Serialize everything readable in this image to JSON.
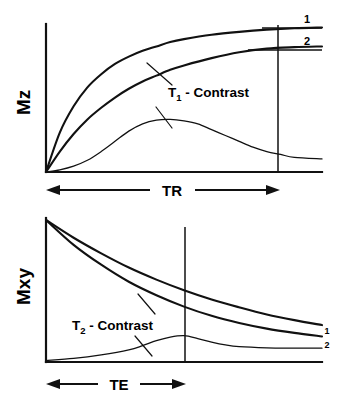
{
  "figure": {
    "background_color": "#ffffff",
    "ink_color": "#111111"
  },
  "chart_data": [
    {
      "type": "line",
      "panel": "top",
      "title": "",
      "xlabel": "TR",
      "ylabel": "Mz",
      "grid": false,
      "legend": "inline-end-labels",
      "annotation": "T1 - Contrast",
      "annotation_base": "T",
      "annotation_sub": "1",
      "annotation_rest": " - Contrast",
      "xlim": [
        0,
        1
      ],
      "ylim": [
        0,
        1
      ],
      "marker_x": 0.83,
      "marker_label": "TR",
      "series": [
        {
          "name": "1",
          "label": "1",
          "kind": "recovery",
          "amplitude": 1.0,
          "rate": 3.6,
          "points": [
            [
              0.0,
              0.0
            ],
            [
              0.05,
              0.27
            ],
            [
              0.1,
              0.45
            ],
            [
              0.15,
              0.58
            ],
            [
              0.2,
              0.67
            ],
            [
              0.25,
              0.74
            ],
            [
              0.3,
              0.79
            ],
            [
              0.35,
              0.83
            ],
            [
              0.4,
              0.86
            ],
            [
              0.45,
              0.89
            ],
            [
              0.5,
              0.91
            ],
            [
              0.6,
              0.94
            ],
            [
              0.7,
              0.96
            ],
            [
              0.8,
              0.975
            ],
            [
              0.9,
              0.985
            ],
            [
              1.0,
              0.99
            ]
          ]
        },
        {
          "name": "2",
          "label": "2",
          "kind": "recovery",
          "amplitude": 0.85,
          "rate": 2.0,
          "points": [
            [
              0.0,
              0.0
            ],
            [
              0.05,
              0.14
            ],
            [
              0.1,
              0.26
            ],
            [
              0.15,
              0.36
            ],
            [
              0.2,
              0.44
            ],
            [
              0.25,
              0.51
            ],
            [
              0.3,
              0.57
            ],
            [
              0.35,
              0.62
            ],
            [
              0.4,
              0.66
            ],
            [
              0.45,
              0.7
            ],
            [
              0.5,
              0.73
            ],
            [
              0.6,
              0.78
            ],
            [
              0.7,
              0.82
            ],
            [
              0.8,
              0.845
            ],
            [
              0.9,
              0.855
            ],
            [
              1.0,
              0.86
            ]
          ]
        },
        {
          "name": "difference",
          "label": "",
          "kind": "difference",
          "points": [
            [
              0.0,
              0.0
            ],
            [
              0.05,
              0.015
            ],
            [
              0.1,
              0.04
            ],
            [
              0.15,
              0.08
            ],
            [
              0.2,
              0.14
            ],
            [
              0.25,
              0.21
            ],
            [
              0.3,
              0.28
            ],
            [
              0.35,
              0.33
            ],
            [
              0.4,
              0.355
            ],
            [
              0.45,
              0.36
            ],
            [
              0.5,
              0.35
            ],
            [
              0.55,
              0.33
            ],
            [
              0.6,
              0.29
            ],
            [
              0.65,
              0.25
            ],
            [
              0.7,
              0.21
            ],
            [
              0.75,
              0.17
            ],
            [
              0.8,
              0.14
            ],
            [
              0.85,
              0.12
            ],
            [
              0.9,
              0.1
            ],
            [
              1.0,
              0.09
            ]
          ]
        }
      ]
    },
    {
      "type": "line",
      "panel": "bottom",
      "title": "",
      "xlabel": "TE",
      "ylabel": "Mxy",
      "grid": false,
      "legend": "inline-end-labels",
      "annotation": "T2 - Contrast",
      "annotation_base": "T",
      "annotation_sub": "2",
      "annotation_rest": " - Contrast",
      "xlim": [
        0,
        1
      ],
      "ylim": [
        0,
        1
      ],
      "marker_x": 0.5,
      "marker_label": "TE",
      "series": [
        {
          "name": "1",
          "label": "1",
          "kind": "decay",
          "amplitude": 1.0,
          "rate": 1.3,
          "points": [
            [
              0.0,
              1.0
            ],
            [
              0.1,
              0.875
            ],
            [
              0.2,
              0.765
            ],
            [
              0.3,
              0.665
            ],
            [
              0.4,
              0.58
            ],
            [
              0.5,
              0.505
            ],
            [
              0.6,
              0.44
            ],
            [
              0.7,
              0.385
            ],
            [
              0.8,
              0.335
            ],
            [
              0.9,
              0.295
            ],
            [
              1.0,
              0.26
            ]
          ]
        },
        {
          "name": "2",
          "label": "2",
          "kind": "decay",
          "amplitude": 1.0,
          "rate": 1.9,
          "points": [
            [
              0.0,
              1.0
            ],
            [
              0.1,
              0.825
            ],
            [
              0.2,
              0.685
            ],
            [
              0.3,
              0.565
            ],
            [
              0.4,
              0.47
            ],
            [
              0.5,
              0.39
            ],
            [
              0.6,
              0.325
            ],
            [
              0.7,
              0.275
            ],
            [
              0.8,
              0.235
            ],
            [
              0.9,
              0.205
            ],
            [
              1.0,
              0.18
            ]
          ]
        },
        {
          "name": "difference",
          "label": "",
          "kind": "difference",
          "points": [
            [
              0.0,
              0.01
            ],
            [
              0.1,
              0.025
            ],
            [
              0.2,
              0.05
            ],
            [
              0.3,
              0.085
            ],
            [
              0.35,
              0.115
            ],
            [
              0.4,
              0.15
            ],
            [
              0.45,
              0.175
            ],
            [
              0.5,
              0.185
            ],
            [
              0.55,
              0.165
            ],
            [
              0.6,
              0.14
            ],
            [
              0.65,
              0.12
            ],
            [
              0.7,
              0.108
            ],
            [
              0.8,
              0.1
            ],
            [
              0.9,
              0.098
            ],
            [
              1.0,
              0.097
            ]
          ]
        }
      ]
    }
  ]
}
